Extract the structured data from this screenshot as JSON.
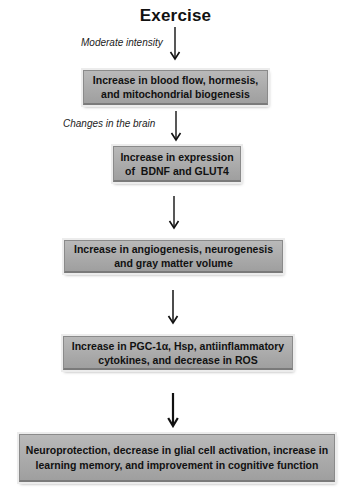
{
  "diagram": {
    "title": "Exercise",
    "colors": {
      "box_fill": "#ababab",
      "box_border": "#8a8a8a",
      "arrow": "#111111",
      "text": "#111111"
    },
    "labels": [
      {
        "id": "moderate-intensity",
        "text": "Moderate intensity"
      },
      {
        "id": "changes-in-brain",
        "text": "Changes in the brain"
      }
    ],
    "boxes": [
      {
        "id": "step-1",
        "lines": [
          "Increase in blood flow, hormesis,",
          "and mitochondrial biogenesis"
        ]
      },
      {
        "id": "step-2",
        "lines": [
          "Increase in expression",
          "of  BDNF and GLUT4"
        ]
      },
      {
        "id": "step-3",
        "lines": [
          "Increase in angiogenesis, neurogenesis",
          "and gray matter volume"
        ]
      },
      {
        "id": "step-4",
        "lines": [
          "Increase in PGC-1α, Hsp, antiinflammatory",
          "cytokines, and decrease in ROS"
        ]
      },
      {
        "id": "step-5",
        "lines": [
          "Neuroprotection, decrease in glial cell activation, increase in",
          "learning memory, and improvement in cognitive function"
        ]
      }
    ],
    "edges": [
      {
        "from": "Exercise",
        "to": "step-1",
        "label": "Moderate intensity"
      },
      {
        "from": "step-1",
        "to": "step-2",
        "label": "Changes in the brain"
      },
      {
        "from": "step-2",
        "to": "step-3",
        "label": ""
      },
      {
        "from": "step-3",
        "to": "step-4",
        "label": ""
      },
      {
        "from": "step-4",
        "to": "step-5",
        "label": ""
      }
    ]
  }
}
